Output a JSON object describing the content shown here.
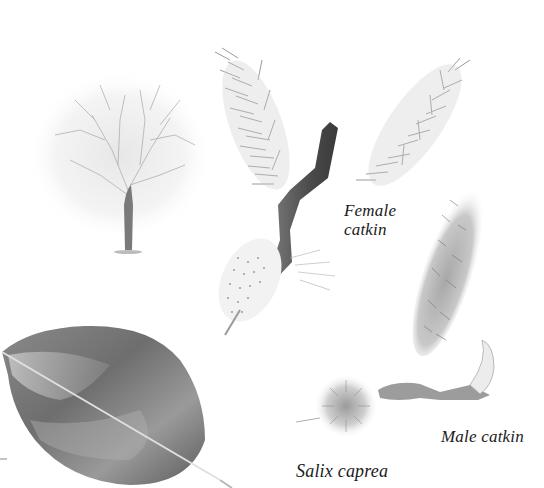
{
  "plate": {
    "subject": "Salix caprea",
    "style": "pencil botanical illustration",
    "background_color": "#ffffff",
    "ink_color": "#1a1a1a"
  },
  "labels": {
    "female_line1": "Female",
    "female_line2": "catkin",
    "male": "Male catkin",
    "species": "Salix caprea"
  },
  "figures": [
    {
      "id": "tree",
      "description": "whole tree silhouette, leafless crown"
    },
    {
      "id": "leaf",
      "description": "single shaded leaf with midrib"
    },
    {
      "id": "female-catkin-twig",
      "description": "forked twig bearing two female catkins"
    },
    {
      "id": "male-catkin-twig",
      "description": "twig with upright male catkin and round catkin"
    }
  ]
}
